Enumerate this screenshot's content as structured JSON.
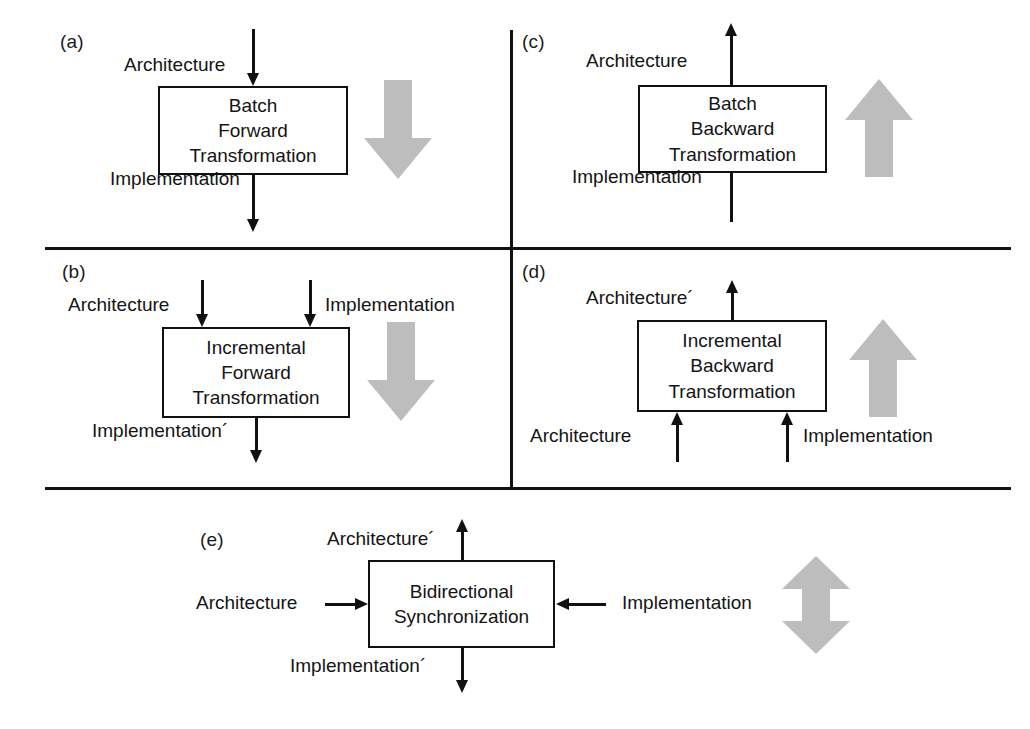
{
  "figure": {
    "colors": {
      "ink": "#111111",
      "gray_arrow": "#bdbdbd",
      "background": "#ffffff"
    }
  },
  "panels": [
    {
      "tag": "(a)",
      "box_lines": [
        "Batch",
        "Forward",
        "Transformation"
      ],
      "inputs": [
        "Architecture"
      ],
      "outputs": [
        "Implementation"
      ],
      "direction_arrow": "down-block-arrow"
    },
    {
      "tag": "(b)",
      "box_lines": [
        "Incremental",
        "Forward",
        "Transformation"
      ],
      "inputs": [
        "Architecture",
        "Implementation"
      ],
      "outputs": [
        "Implementation´"
      ],
      "direction_arrow": "down-block-arrow"
    },
    {
      "tag": "(c)",
      "box_lines": [
        "Batch",
        "Backward",
        "Transformation"
      ],
      "inputs": [
        "Implementation"
      ],
      "outputs": [
        "Architecture"
      ],
      "direction_arrow": "up-block-arrow"
    },
    {
      "tag": "(d)",
      "box_lines": [
        "Incremental",
        "Backward",
        "Transformation"
      ],
      "inputs": [
        "Architecture",
        "Implementation"
      ],
      "outputs": [
        "Architecture´"
      ],
      "direction_arrow": "up-block-arrow"
    },
    {
      "tag": "(e)",
      "box_lines": [
        "Bidirectional",
        "Synchronization"
      ],
      "inputs": [
        "Architecture",
        "Implementation"
      ],
      "outputs": [
        "Architecture´",
        "Implementation´"
      ],
      "direction_arrow": "up-down-block-arrow"
    }
  ]
}
